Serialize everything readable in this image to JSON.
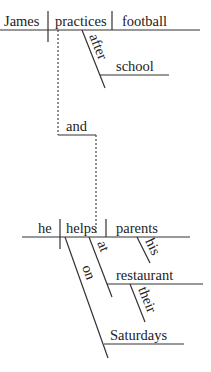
{
  "diagram": {
    "type": "Reed-Kellogg sentence diagram",
    "clause1": {
      "subject": "James",
      "verb": "practices",
      "object": "football",
      "modifiers": {
        "preposition": "after",
        "prep_object": "school"
      }
    },
    "conjunction": "and",
    "clause2": {
      "subject": "he",
      "verb": "helps",
      "object": "parents",
      "modifiers": {
        "object_modifier": "his",
        "preposition1": "at",
        "prep1_object": "restaurant",
        "prep1_object_modifier": "their",
        "preposition2": "on",
        "prep2_object": "Saturdays"
      }
    },
    "colors": {
      "line": "#333333",
      "text": "#222222",
      "background": "#ffffff"
    }
  }
}
